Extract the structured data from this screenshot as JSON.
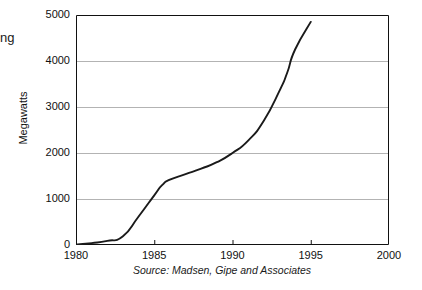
{
  "figure": {
    "clipped_heading_fragment": "ng",
    "source_note": "Source: Madsen, Gipe and Associates",
    "axis_color": "#111111",
    "grid_color": "#b3b3b3",
    "line_color": "#1a1a1a"
  },
  "chart_data": {
    "type": "line",
    "title": "",
    "xlabel": "",
    "ylabel": "Megawatts",
    "xlim": [
      1980,
      2000
    ],
    "ylim": [
      0,
      5000
    ],
    "grid": "horizontal",
    "legend": "none",
    "xticks": [
      1980,
      1985,
      1990,
      1995,
      2000
    ],
    "xtick_labels": [
      "1980",
      "1985",
      "1990",
      "1995",
      "2000"
    ],
    "yticks": [
      0,
      1000,
      2000,
      3000,
      4000,
      5000
    ],
    "ytick_labels": [
      "0",
      "1000",
      "2000",
      "3000",
      "4000",
      "5000"
    ],
    "series": [
      {
        "name": "Installed wind capacity",
        "x": [
          1980,
          1981,
          1982,
          1983,
          1984,
          1985,
          1985.5,
          1986,
          1987,
          1988,
          1989,
          1990,
          1991,
          1992,
          1993,
          1993.5,
          1994,
          1995
        ],
        "values": [
          10,
          40,
          90,
          190,
          620,
          1080,
          1300,
          1420,
          1540,
          1660,
          1800,
          2000,
          2270,
          2700,
          3350,
          3750,
          4250,
          4850
        ]
      }
    ]
  }
}
